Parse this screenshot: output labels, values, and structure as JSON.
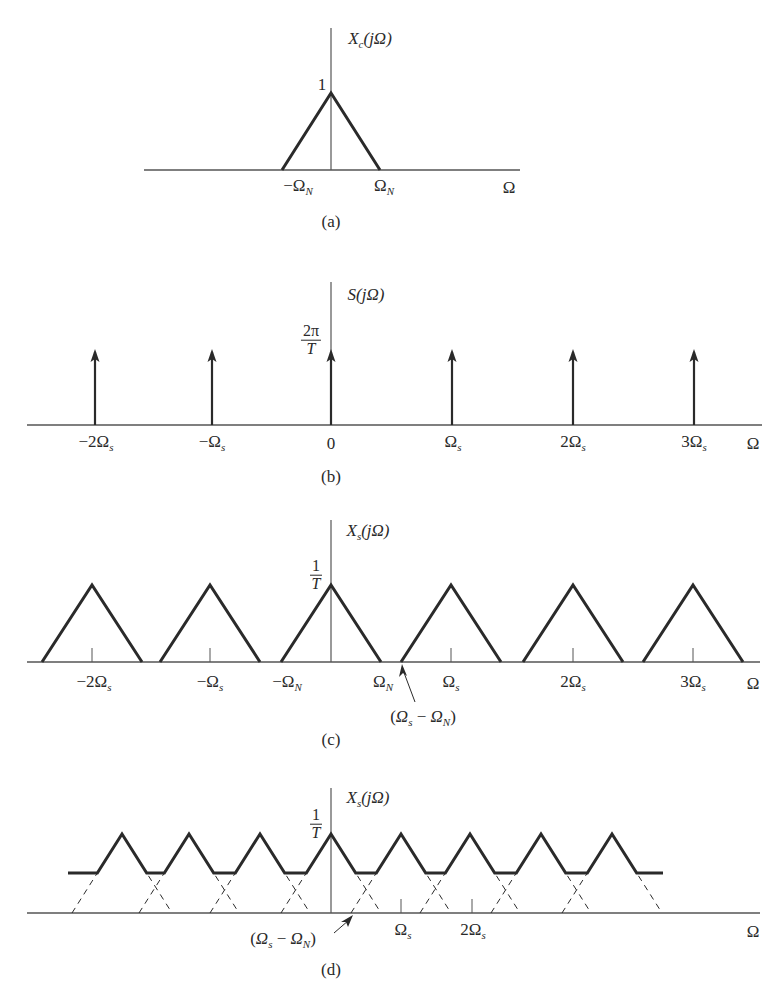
{
  "colors": {
    "ink": "#2a2a2a",
    "axis": "#555555",
    "background": "#ffffff"
  },
  "panels": [
    {
      "id": "a",
      "caption": "(a)",
      "ylabel": "X_c(jΩ)",
      "ylabel_main": "X",
      "ylabel_sub": "c",
      "ylabel_arg": "(jΩ)",
      "peak_label": "1",
      "xlabels": [
        {
          "text": "−Ω",
          "sub": "N",
          "x": 298
        },
        {
          "text": "Ω",
          "sub": "N",
          "x": 384
        },
        {
          "text": "Ω",
          "sub": "",
          "x": 509
        }
      ]
    },
    {
      "id": "b",
      "caption": "(b)",
      "ylabel_main": "S",
      "ylabel_sub": "",
      "ylabel_arg": "(jΩ)",
      "peak_label_num": "2π",
      "peak_label_den": "T",
      "xlabels": [
        {
          "text": "−2Ω",
          "sub": "s",
          "x": 96
        },
        {
          "text": "−Ω",
          "sub": "s",
          "x": 212
        },
        {
          "text": "0",
          "sub": "",
          "x": 331
        },
        {
          "text": "Ω",
          "sub": "s",
          "x": 453
        },
        {
          "text": "2Ω",
          "sub": "s",
          "x": 573
        },
        {
          "text": "3Ω",
          "sub": "s",
          "x": 694
        },
        {
          "text": "Ω",
          "sub": "",
          "x": 753
        }
      ]
    },
    {
      "id": "c",
      "caption": "(c)",
      "ylabel_main": "X",
      "ylabel_sub": "s",
      "ylabel_arg": "(jΩ)",
      "peak_label_num": "1",
      "peak_label_den": "T",
      "xlabels": [
        {
          "text": "−2Ω",
          "sub": "s",
          "x": 94
        },
        {
          "text": "−Ω",
          "sub": "s",
          "x": 210
        },
        {
          "text": "−Ω",
          "sub": "N",
          "x": 287
        },
        {
          "text": "Ω",
          "sub": "N",
          "x": 383
        },
        {
          "text": "Ω",
          "sub": "s",
          "x": 451
        },
        {
          "text": "2Ω",
          "sub": "s",
          "x": 573
        },
        {
          "text": "3Ω",
          "sub": "s",
          "x": 693
        },
        {
          "text": "Ω",
          "sub": "",
          "x": 753
        }
      ],
      "annotation": "(Ω_s − Ω_N)"
    },
    {
      "id": "d",
      "caption": "(d)",
      "ylabel_main": "X",
      "ylabel_sub": "s",
      "ylabel_arg": "(jΩ)",
      "peak_label_num": "1",
      "peak_label_den": "T",
      "xlabels": [
        {
          "text": "Ω",
          "sub": "s",
          "x": 403
        },
        {
          "text": "2Ω",
          "sub": "s",
          "x": 473
        },
        {
          "text": "Ω",
          "sub": "",
          "x": 753
        }
      ],
      "annotation": "(Ω_s − Ω_N)"
    }
  ],
  "chart_data": [
    {
      "type": "line",
      "title": "(a) X_c(jΩ)",
      "xlabel": "Ω",
      "ylabel": "X_c(jΩ)",
      "description": "Triangular bandlimited spectrum, peak 1 at Ω=0, zero at ±Ω_N",
      "x": [
        "-Ω_N",
        "0",
        "Ω_N"
      ],
      "y": [
        0,
        1,
        0
      ]
    },
    {
      "type": "stem",
      "title": "(b) S(jΩ)",
      "xlabel": "Ω",
      "ylabel": "S(jΩ)",
      "description": "Impulse train of area 2π/T at multiples of Ω_s",
      "x": [
        "-2Ω_s",
        "-Ω_s",
        "0",
        "Ω_s",
        "2Ω_s",
        "3Ω_s"
      ],
      "y": [
        "2π/T",
        "2π/T",
        "2π/T",
        "2π/T",
        "2π/T",
        "2π/T"
      ]
    },
    {
      "type": "line",
      "title": "(c) X_s(jΩ), Ω_s > 2Ω_N (no aliasing)",
      "xlabel": "Ω",
      "ylabel": "X_s(jΩ)",
      "peak": "1/T",
      "centers": [
        "-2Ω_s",
        "-Ω_s",
        "0",
        "Ω_s",
        "2Ω_s",
        "3Ω_s"
      ],
      "annotation": "(Ω_s − Ω_N)"
    },
    {
      "type": "line",
      "title": "(d) X_s(jΩ), Ω_s < 2Ω_N (aliasing)",
      "xlabel": "Ω",
      "ylabel": "X_s(jΩ)",
      "peak": "1/T",
      "centers": [
        "-3Ω_s",
        "-2Ω_s",
        "-Ω_s",
        "0",
        "Ω_s",
        "2Ω_s",
        "3Ω_s",
        "4Ω_s"
      ],
      "overlap_level": 0.5,
      "annotation": "(Ω_s − Ω_N)"
    }
  ],
  "geometry": {
    "a": {
      "axisX": 331,
      "axisTop": 28,
      "base": 170,
      "peak": 93,
      "lineL": 144,
      "lineR": 520,
      "halfW": 49
    },
    "b": {
      "axisX": 331,
      "axisTop": 282,
      "base": 425,
      "tip": 349,
      "lineL": 27,
      "lineR": 762,
      "impulses": [
        95,
        212,
        331,
        452,
        573,
        694
      ]
    },
    "c": {
      "axisX": 331,
      "axisTop": 520,
      "base": 662,
      "peak": 585,
      "lineL": 27,
      "lineR": 760,
      "halfW": 50,
      "centers": [
        92,
        210,
        331,
        451,
        573,
        693
      ],
      "ticks": [
        92,
        210,
        451,
        573,
        693
      ]
    },
    "d": {
      "axisX": 331,
      "axisTop": 788,
      "base": 913,
      "peak": 834,
      "flat": 873,
      "lineL": 27,
      "lineR": 760,
      "halfW": 50,
      "centers": [
        122,
        189,
        260,
        331,
        401,
        470,
        541,
        612
      ],
      "flatL": 68,
      "flatR": 663,
      "ticks": [
        401,
        472
      ]
    }
  }
}
